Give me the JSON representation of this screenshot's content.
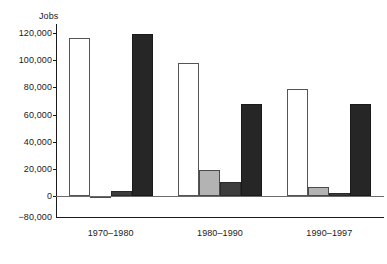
{
  "chart_data": {
    "type": "bar",
    "title": "",
    "ylabel": "Jobs",
    "xlabel": "",
    "categories": [
      "1970–1980",
      "1980–1990",
      "1990–1997"
    ],
    "ytick_labels": [
      "120,000",
      "100,000",
      "80,000",
      "60,000",
      "40,000",
      "20,000",
      "0",
      "−80,000"
    ],
    "ytick_values": [
      120000,
      100000,
      80000,
      60000,
      40000,
      20000,
      0,
      -80000
    ],
    "ylim": [
      -80000,
      120000
    ],
    "axis_break": true,
    "axis_break_note": "Scale is broken between 0 and −80,000",
    "grid": false,
    "legend_position": "none",
    "series": [
      {
        "name": "series-1",
        "color": "#ffffff",
        "style": "white-outlined",
        "values": [
          116000,
          98000,
          79000
        ]
      },
      {
        "name": "series-2",
        "color": "#b3b3b3",
        "style": "light-gray",
        "values": [
          -4000,
          19000,
          6500
        ]
      },
      {
        "name": "series-3",
        "color": "#3d3d3d",
        "style": "dark-gray",
        "values": [
          4000,
          10000,
          2000
        ]
      },
      {
        "name": "series-4",
        "color": "#262626",
        "style": "black",
        "values": [
          119000,
          68000,
          68000
        ]
      }
    ]
  },
  "colors": {
    "axis": "#1a1a1a",
    "text": "#1a1a1a",
    "background": "#ffffff",
    "series1": "#ffffff",
    "series2": "#b3b3b3",
    "series3": "#3d3d3d",
    "series4": "#262626"
  }
}
